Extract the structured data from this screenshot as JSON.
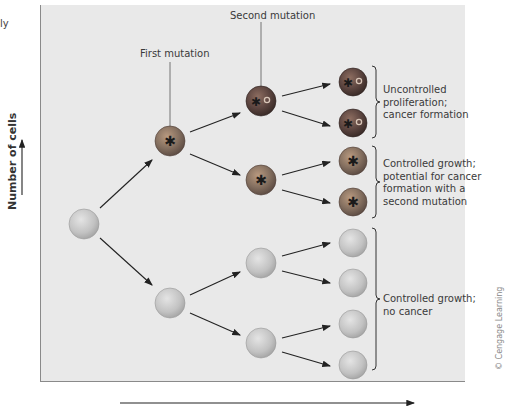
{
  "corner_text": "ly",
  "labels": {
    "first_mutation": "First mutation",
    "second_mutation": "Second mutation"
  },
  "outcomes": [
    {
      "lines": [
        "Uncontrolled",
        "proliferation;",
        "cancer formation"
      ]
    },
    {
      "lines": [
        "Controlled growth;",
        "potential for cancer",
        "formation with a",
        "second mutation"
      ]
    },
    {
      "lines": [
        "Controlled growth;",
        "no cancer"
      ]
    }
  ],
  "axes": {
    "y_label": "Number of cells",
    "x_label": ""
  },
  "credit": "© Cengage Learning",
  "colors": {
    "panel": "#e9e9e9",
    "normal_cell": "#c4c4c4",
    "mutated_cell": "#7e6b60",
    "double_mutated_cell": "#5a4540",
    "arrow": "#222222"
  }
}
